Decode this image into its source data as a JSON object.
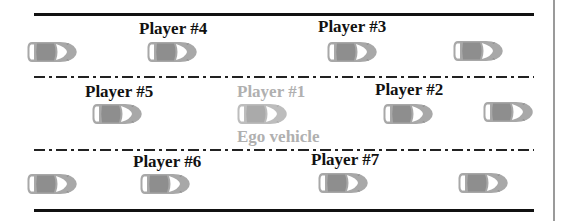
{
  "diagram": {
    "colors": {
      "road_line": "#111111",
      "car_body": "#a6a6a6",
      "car_roof": "#8c8c8c",
      "ego_label": "#b0b0b0",
      "player_label": "#111111"
    },
    "lanes": [
      {
        "name": "top-lane",
        "cars": [
          52,
          172,
          352,
          478
        ],
        "y": 52
      },
      {
        "name": "middle-lane",
        "cars": [
          117,
          262,
          408,
          507
        ],
        "y": 114
      },
      {
        "name": "bottom-lane",
        "cars": [
          52,
          165,
          343,
          483
        ],
        "y": 184
      }
    ],
    "labels": {
      "player4": "Player #4",
      "player3": "Player #3",
      "player5": "Player #5",
      "player1": "Player #1",
      "player2": "Player #2",
      "ego": "Ego vehicle",
      "player6": "Player #6",
      "player7": "Player #7"
    }
  }
}
